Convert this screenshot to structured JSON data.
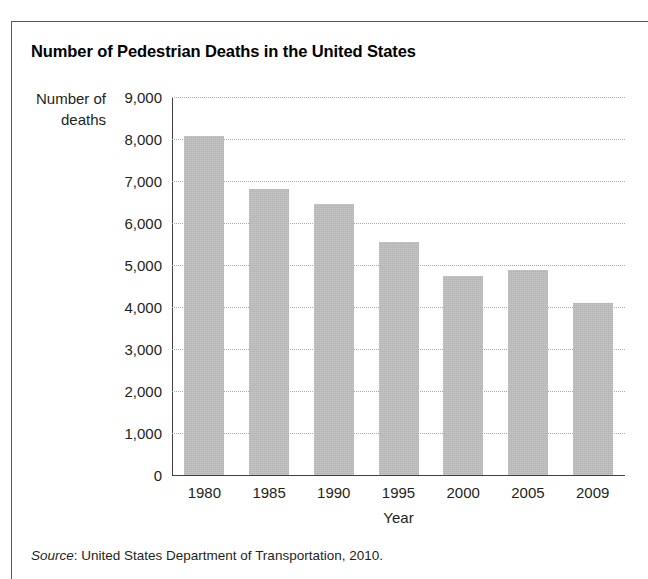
{
  "figure": {
    "title": "Number of Pedestrian Deaths in the United States",
    "source_word": "Source",
    "source_rest": ": United States Department of Transportation, 2010.",
    "frame_color": "#58595b",
    "bar_color": "#b4b4b4",
    "axis_color": "#414042",
    "grid_color": "#a7a9ac"
  },
  "chart_data": {
    "type": "bar",
    "title": "Number of Pedestrian Deaths in the United States",
    "xlabel": "Year",
    "ylabel": "Number of deaths",
    "categories": [
      "1980",
      "1985",
      "1990",
      "1995",
      "2000",
      "2005",
      "2009"
    ],
    "values": [
      8070,
      6800,
      6450,
      5550,
      4750,
      4880,
      4090
    ],
    "ylim": [
      0,
      9000
    ],
    "ytick_labels": [
      "9,000",
      "8,000",
      "7,000",
      "6,000",
      "5,000",
      "4,000",
      "3,000",
      "2,000",
      "1,000",
      "0"
    ],
    "ytick_values": [
      9000,
      8000,
      7000,
      6000,
      5000,
      4000,
      3000,
      2000,
      1000,
      0
    ],
    "grid": "horizontal-dotted",
    "legend": "none",
    "source": "Source: United States Department of Transportation, 2010."
  }
}
